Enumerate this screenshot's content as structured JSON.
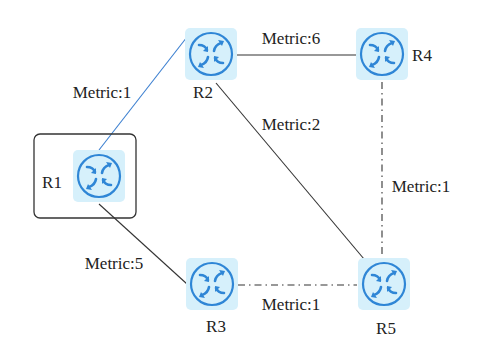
{
  "diagram": {
    "type": "network-topology",
    "highlighted_router": "R1",
    "colors": {
      "router_fill": "#d6f0fb",
      "router_stroke": "#2f86d6",
      "link_default": "#333333",
      "link_highlight": "#3b7fd0"
    },
    "routers": [
      {
        "id": "R1",
        "label": "R1",
        "icon": "router-icon"
      },
      {
        "id": "R2",
        "label": "R2",
        "icon": "router-icon"
      },
      {
        "id": "R3",
        "label": "R3",
        "icon": "router-icon"
      },
      {
        "id": "R4",
        "label": "R4",
        "icon": "router-icon"
      },
      {
        "id": "R5",
        "label": "R5",
        "icon": "router-icon"
      }
    ],
    "links": [
      {
        "from": "R1",
        "to": "R2",
        "label": "Metric:1",
        "style": "solid",
        "highlight": true
      },
      {
        "from": "R2",
        "to": "R4",
        "label": "Metric:6",
        "style": "solid",
        "highlight": false
      },
      {
        "from": "R2",
        "to": "R5",
        "label": "Metric:2",
        "style": "solid",
        "highlight": false
      },
      {
        "from": "R4",
        "to": "R5",
        "label": "Metric:1",
        "style": "dash-dot",
        "highlight": false
      },
      {
        "from": "R1",
        "to": "R3",
        "label": "Metric:5",
        "style": "solid",
        "highlight": false
      },
      {
        "from": "R3",
        "to": "R5",
        "label": "Metric:1",
        "style": "dash-dot",
        "highlight": false
      }
    ]
  }
}
